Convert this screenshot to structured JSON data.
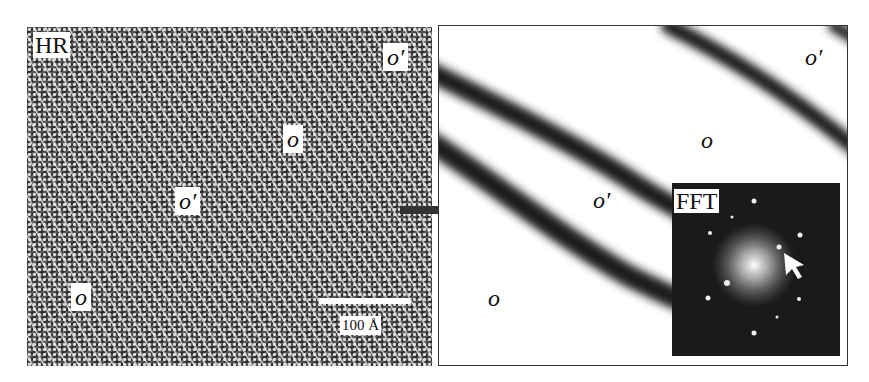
{
  "figure": {
    "left_panel": {
      "label": "HR",
      "region_labels": {
        "o_prime_top_right": "o′",
        "o_center": "o",
        "o_prime_center": "o′",
        "o_bottom_left": "o"
      },
      "scale_bar": {
        "label": "100 Å"
      }
    },
    "right_panel": {
      "region_labels": {
        "o_prime_top_right": "o′",
        "o_center": "o",
        "o_prime_middle": "o′",
        "o_bottom_left": "o"
      },
      "inset": {
        "label": "FFT"
      }
    }
  },
  "colors": {
    "background": "#ffffff",
    "dark_band": "#1e1e1e",
    "fft_bg": "#1a1a1a"
  }
}
